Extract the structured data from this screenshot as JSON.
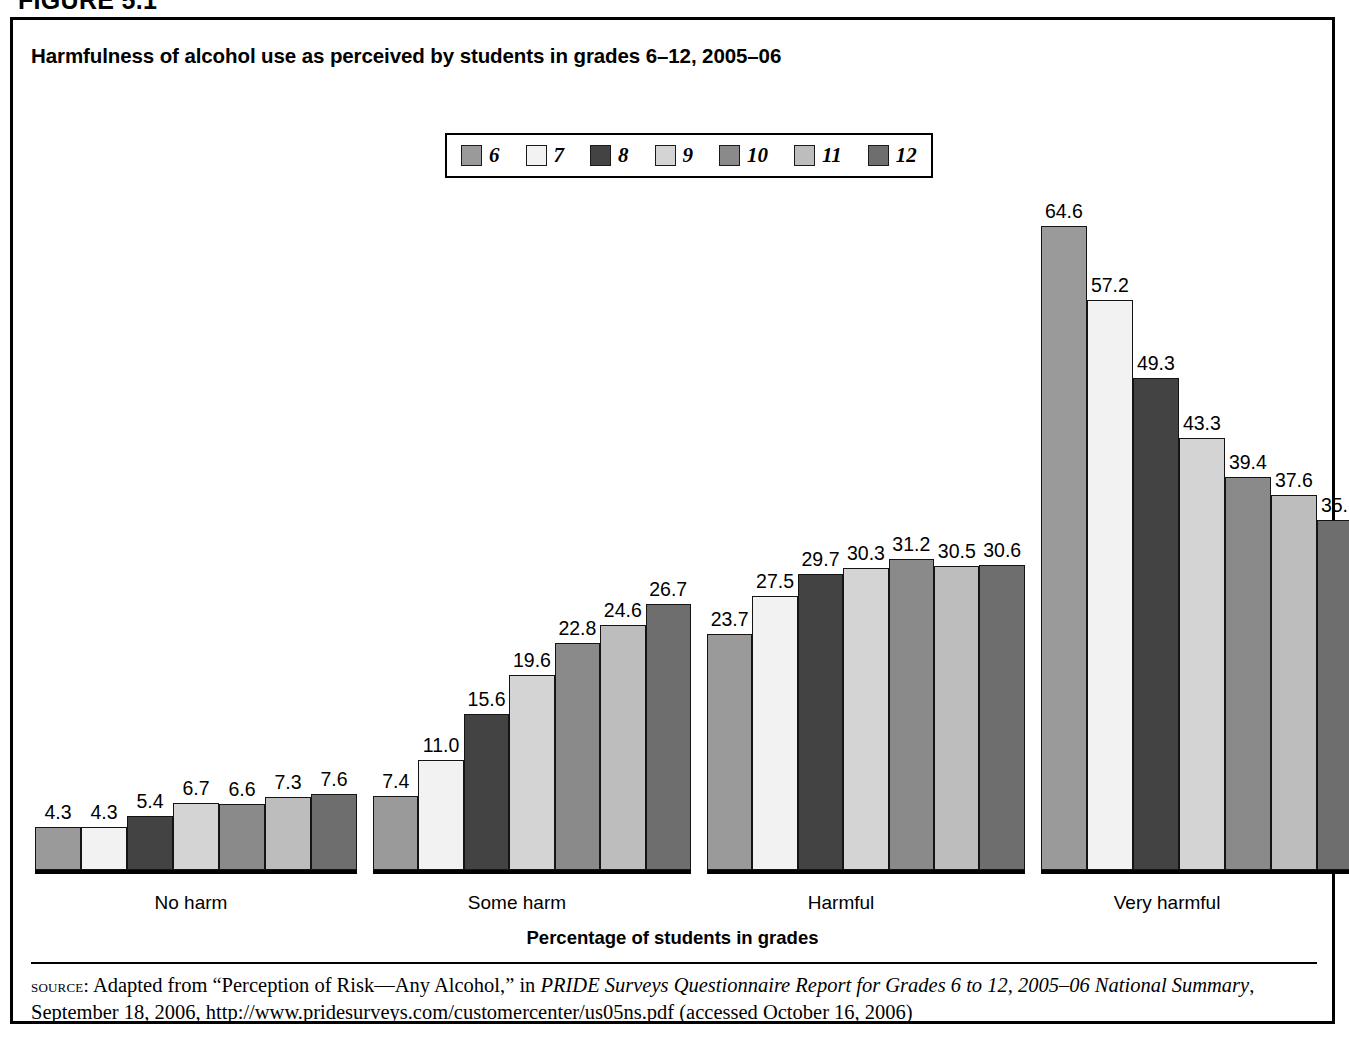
{
  "figure": {
    "caption": "FIGURE 5.1",
    "title": "Harmfulness of alcohol use as perceived by students in grades 6–12, 2005–06",
    "axis_title": "Percentage of students in grades"
  },
  "legend": {
    "entries": [
      {
        "label": "6",
        "color": "#9a9a9a"
      },
      {
        "label": "7",
        "color": "#f2f2f2"
      },
      {
        "label": "8",
        "color": "#434343"
      },
      {
        "label": "9",
        "color": "#d4d4d4"
      },
      {
        "label": "10",
        "color": "#8a8a8a"
      },
      {
        "label": "11",
        "color": "#bdbdbd"
      },
      {
        "label": "12",
        "color": "#6e6e6e"
      }
    ]
  },
  "source": {
    "kicker": "source:",
    "line1_pre": " Adapted from “Perception of Risk—Any Alcohol,” in ",
    "line1_italic": "PRIDE Surveys Questionnaire Report for Grades 6 to 12, 2005–06 National Summary",
    "line1_post": ",",
    "line2": "September 18, 2006, http://www.pridesurveys.com/customercenter/us05ns.pdf (accessed October 16, 2006)"
  },
  "chart_data": {
    "type": "bar",
    "title": "Harmfulness of alcohol use as perceived by students in grades 6–12, 2005–06",
    "xlabel": "Percentage of students in grades",
    "ylabel": "",
    "ylim": [
      0,
      70
    ],
    "grid": false,
    "legend_position": "top-center",
    "categories": [
      "No harm",
      "Some harm",
      "Harmful",
      "Very harmful"
    ],
    "series": [
      {
        "name": "6",
        "values": [
          4.3,
          7.4,
          23.7,
          64.6
        ]
      },
      {
        "name": "7",
        "values": [
          4.3,
          11.0,
          27.5,
          57.2
        ]
      },
      {
        "name": "8",
        "values": [
          5.4,
          15.6,
          29.7,
          49.3
        ]
      },
      {
        "name": "9",
        "values": [
          6.7,
          19.6,
          30.3,
          43.3
        ]
      },
      {
        "name": "10",
        "values": [
          6.6,
          22.8,
          31.2,
          39.4
        ]
      },
      {
        "name": "11",
        "values": [
          7.3,
          24.6,
          30.5,
          37.6
        ]
      },
      {
        "name": "12",
        "values": [
          7.6,
          26.7,
          30.6,
          35.1
        ]
      }
    ]
  }
}
